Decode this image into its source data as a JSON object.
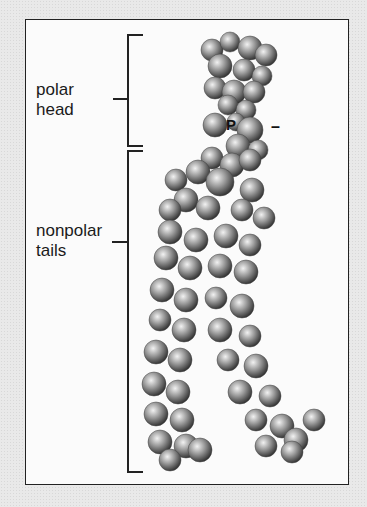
{
  "diagram": {
    "labels": {
      "polar_head": "polar\nhead",
      "nonpolar_tails": "nonpolar\ntails",
      "phosphorus": "P",
      "charge": "–"
    },
    "colors": {
      "background": "#e9e9e9",
      "panel": "#fbfbfb",
      "border": "#222222",
      "atom_light": "#f2f2f2",
      "atom_mid": "#9a9a9a",
      "atom_dark": "#2a2a2a"
    },
    "brackets": {
      "head": {
        "x": 127,
        "y1": 35,
        "y2": 146,
        "tick_y": 99
      },
      "tails": {
        "x": 127,
        "y1": 151,
        "y2": 472,
        "tick_y": 242
      }
    },
    "atoms": [
      [
        212,
        50,
        11
      ],
      [
        230,
        42,
        10
      ],
      [
        250,
        48,
        12
      ],
      [
        266,
        55,
        11
      ],
      [
        220,
        66,
        12
      ],
      [
        244,
        70,
        11
      ],
      [
        262,
        76,
        10
      ],
      [
        215,
        88,
        11
      ],
      [
        234,
        92,
        12
      ],
      [
        254,
        92,
        11
      ],
      [
        228,
        105,
        10
      ],
      [
        246,
        110,
        10
      ],
      [
        215,
        125,
        12
      ],
      [
        236,
        122,
        9
      ],
      [
        250,
        130,
        13
      ],
      [
        238,
        146,
        12
      ],
      [
        258,
        150,
        10
      ],
      [
        212,
        158,
        11
      ],
      [
        232,
        165,
        12
      ],
      [
        250,
        160,
        11
      ],
      [
        198,
        172,
        12
      ],
      [
        176,
        180,
        11
      ],
      [
        220,
        182,
        14
      ],
      [
        252,
        190,
        12
      ],
      [
        186,
        200,
        12
      ],
      [
        170,
        210,
        11
      ],
      [
        208,
        208,
        12
      ],
      [
        242,
        210,
        11
      ],
      [
        264,
        218,
        11
      ],
      [
        170,
        232,
        12
      ],
      [
        196,
        240,
        12
      ],
      [
        226,
        236,
        12
      ],
      [
        250,
        245,
        11
      ],
      [
        166,
        258,
        12
      ],
      [
        190,
        268,
        12
      ],
      [
        220,
        266,
        12
      ],
      [
        246,
        272,
        12
      ],
      [
        162,
        290,
        12
      ],
      [
        186,
        300,
        12
      ],
      [
        216,
        298,
        11
      ],
      [
        242,
        306,
        12
      ],
      [
        160,
        320,
        11
      ],
      [
        184,
        330,
        12
      ],
      [
        220,
        330,
        12
      ],
      [
        250,
        336,
        11
      ],
      [
        156,
        352,
        12
      ],
      [
        180,
        360,
        12
      ],
      [
        228,
        360,
        11
      ],
      [
        256,
        366,
        12
      ],
      [
        154,
        384,
        12
      ],
      [
        178,
        392,
        12
      ],
      [
        240,
        392,
        12
      ],
      [
        270,
        396,
        11
      ],
      [
        156,
        414,
        12
      ],
      [
        182,
        420,
        12
      ],
      [
        256,
        420,
        11
      ],
      [
        282,
        426,
        12
      ],
      [
        160,
        442,
        12
      ],
      [
        186,
        446,
        12
      ],
      [
        266,
        446,
        11
      ],
      [
        296,
        440,
        12
      ],
      [
        314,
        420,
        11
      ],
      [
        170,
        460,
        11
      ],
      [
        200,
        450,
        12
      ],
      [
        292,
        452,
        11
      ]
    ]
  }
}
